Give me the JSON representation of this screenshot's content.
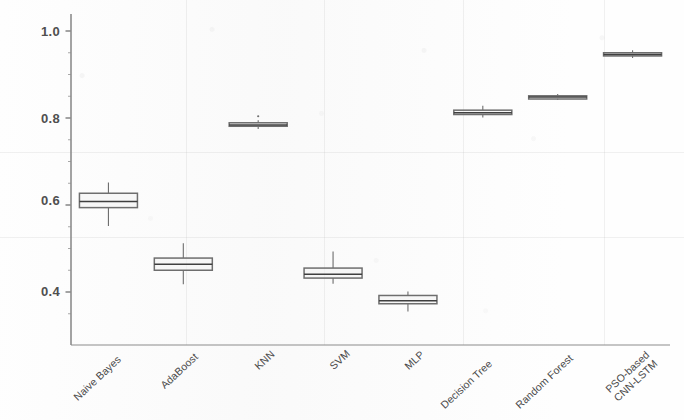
{
  "figure": {
    "width": 684,
    "height": 420,
    "background": "#fefefe",
    "box_color": "#6e6e6e",
    "line_color": "#555555",
    "axis_color": "#8c8c8c"
  },
  "axes": {
    "y_ticks": [
      "1.0",
      "0.8",
      "0.6",
      "0.4"
    ],
    "y_tick_values": [
      1.0,
      0.8,
      0.6,
      0.4
    ],
    "ylim": [
      0.33,
      1.04
    ],
    "x_spine": true,
    "y_spine": true,
    "top_spine": false,
    "right_spine": false,
    "grid": false
  },
  "chart_data": {
    "type": "box",
    "title": "",
    "xlabel": "",
    "ylabel": "",
    "ylim": [
      0.33,
      1.04
    ],
    "grid": false,
    "legend": "none",
    "categories": [
      "Naive Bayes",
      "AdaBoost",
      "KNN",
      "SVM",
      "MLP",
      "Decision Tree",
      "Random Forest",
      "PSO-based CNN-LSTM"
    ],
    "category_lines": [
      [
        "Naive Bayes"
      ],
      [
        "AdaBoost"
      ],
      [
        "KNN"
      ],
      [
        "SVM"
      ],
      [
        "MLP"
      ],
      [
        "Decision Tree"
      ],
      [
        "Random Forest"
      ],
      [
        "PSO-based",
        "CNN-LSTM"
      ]
    ],
    "boxes": [
      {
        "category": "Naive Bayes",
        "whisker_low": 0.552,
        "q1": 0.594,
        "median": 0.608,
        "q3": 0.627,
        "whisker_high": 0.652,
        "outliers": []
      },
      {
        "category": "AdaBoost",
        "whisker_low": 0.418,
        "q1": 0.45,
        "median": 0.464,
        "q3": 0.478,
        "whisker_high": 0.512,
        "outliers": []
      },
      {
        "category": "KNN",
        "whisker_low": 0.775,
        "q1": 0.781,
        "median": 0.784,
        "q3": 0.789,
        "whisker_high": 0.795,
        "outliers": [
          0.804
        ]
      },
      {
        "category": "SVM",
        "whisker_low": 0.419,
        "q1": 0.432,
        "median": 0.441,
        "q3": 0.455,
        "whisker_high": 0.493,
        "outliers": []
      },
      {
        "category": "MLP",
        "whisker_low": 0.355,
        "q1": 0.373,
        "median": 0.38,
        "q3": 0.392,
        "whisker_high": 0.401,
        "outliers": []
      },
      {
        "category": "Decision Tree",
        "whisker_low": 0.801,
        "q1": 0.808,
        "median": 0.812,
        "q3": 0.818,
        "whisker_high": 0.828,
        "outliers": []
      },
      {
        "category": "Random Forest",
        "whisker_low": 0.842,
        "q1": 0.845,
        "median": 0.848,
        "q3": 0.851,
        "whisker_high": 0.855,
        "outliers": []
      },
      {
        "category": "PSO-based CNN-LSTM",
        "whisker_low": 0.938,
        "q1": 0.943,
        "median": 0.946,
        "q3": 0.95,
        "whisker_high": 0.956,
        "outliers": []
      }
    ]
  }
}
